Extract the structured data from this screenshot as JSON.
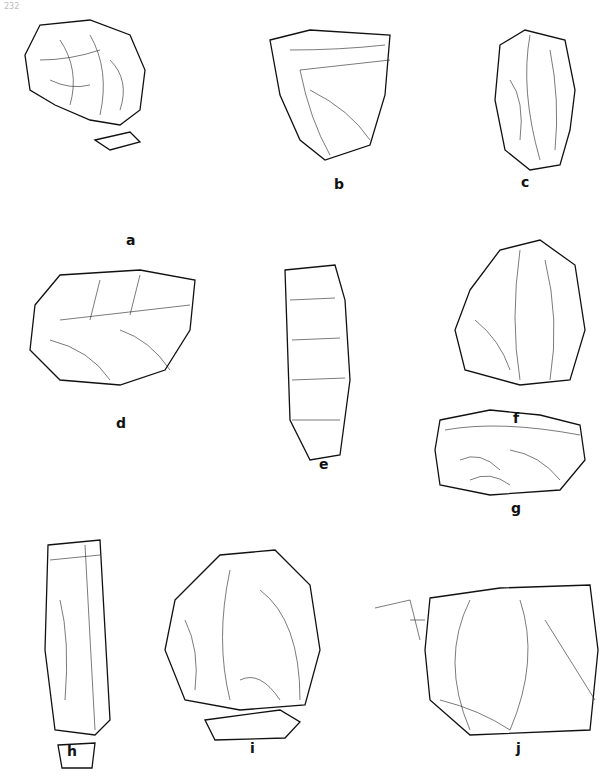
{
  "page": {
    "number": "232"
  },
  "figure": {
    "panels": [
      {
        "label": "a",
        "x": 130,
        "y": 244
      },
      {
        "label": "b",
        "x": 338,
        "y": 188
      },
      {
        "label": "c",
        "x": 525,
        "y": 186
      },
      {
        "label": "d",
        "x": 120,
        "y": 427
      },
      {
        "label": "e",
        "x": 323,
        "y": 468
      },
      {
        "label": "f",
        "x": 517,
        "y": 422
      },
      {
        "label": "g",
        "x": 515,
        "y": 510
      },
      {
        "label": "h",
        "x": 71,
        "y": 755
      },
      {
        "label": "i",
        "x": 253,
        "y": 752
      },
      {
        "label": "j",
        "x": 519,
        "y": 752
      }
    ]
  }
}
